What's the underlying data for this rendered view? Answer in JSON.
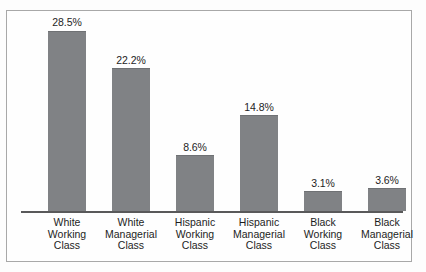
{
  "chart_data": {
    "type": "bar",
    "title": "",
    "subtitle": "",
    "xlabel": "",
    "ylabel": "",
    "ylim": [
      0,
      30
    ],
    "grid": false,
    "legend": "none",
    "orientation": "vertical",
    "bar_color": "#808285",
    "axis_color": "#59595a",
    "border_color": "#a8a8a8",
    "background": "#fefefe",
    "value_suffix": "%",
    "categories": [
      "White Working Class",
      "White Managerial Class",
      "Hispanic Working Class",
      "Hispanic Managerial Class",
      "Black Working Class",
      "Black Managerial Class"
    ],
    "category_lines": [
      [
        "White",
        "Working",
        "Class"
      ],
      [
        "White",
        "Managerial",
        "Class"
      ],
      [
        "Hispanic",
        "Working",
        "Class"
      ],
      [
        "Hispanic",
        "Managerial",
        "Class"
      ],
      [
        "Black",
        "Working",
        "Class"
      ],
      [
        "Black",
        "Managerial",
        "Class"
      ]
    ],
    "values": [
      28.5,
      22.2,
      8.6,
      14.8,
      3.1,
      3.6
    ],
    "value_labels": [
      "28.5%",
      "22.2%",
      "8.6%",
      "14.8%",
      "3.1%",
      "3.6%"
    ]
  }
}
